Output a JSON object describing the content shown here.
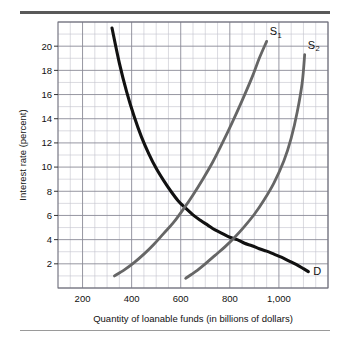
{
  "figure": {
    "background": "#ffffff",
    "rule_top_color": "#595959",
    "rule_bottom_color": "#9a9a9a"
  },
  "chart_data": {
    "type": "line",
    "title": "",
    "xlabel": "Quantity of loanable funds (in billions of dollars)",
    "ylabel": "Interest rate (percent)",
    "xlim": [
      100,
      1200
    ],
    "ylim": [
      0,
      22
    ],
    "grid": true,
    "grid_major_color": "#8a8a96",
    "grid_minor_color": "#c3c3cc",
    "x_major_step": 200,
    "x_minor_step": 50,
    "y_major_step": 2,
    "y_minor_step": 1,
    "xticks": [
      200,
      400,
      600,
      800,
      1000
    ],
    "xticklabels": [
      "200",
      "400",
      "600",
      "800",
      "1,000"
    ],
    "yticks": [
      2,
      4,
      6,
      8,
      10,
      12,
      14,
      16,
      18,
      20
    ],
    "yticklabels": [
      "2",
      "4",
      "6",
      "8",
      "10",
      "12",
      "14",
      "16",
      "18",
      "20"
    ],
    "legend_position": "inline-curve-labels",
    "series": [
      {
        "name": "D",
        "label": "D",
        "label_sub": "",
        "color": "#111111",
        "width": 3.1,
        "points": [
          [
            320,
            21.5
          ],
          [
            350,
            18.6
          ],
          [
            380,
            16.2
          ],
          [
            410,
            14.2
          ],
          [
            440,
            12.5
          ],
          [
            470,
            11.1
          ],
          [
            500,
            9.9
          ],
          [
            530,
            8.9
          ],
          [
            560,
            8.0
          ],
          [
            590,
            7.2
          ],
          [
            620,
            6.6
          ],
          [
            650,
            6.05
          ],
          [
            680,
            5.6
          ],
          [
            710,
            5.2
          ],
          [
            740,
            4.8
          ],
          [
            770,
            4.5
          ],
          [
            800,
            4.2
          ],
          [
            830,
            4.0
          ],
          [
            860,
            3.7
          ],
          [
            890,
            3.5
          ],
          [
            920,
            3.25
          ],
          [
            950,
            3.05
          ],
          [
            980,
            2.8
          ],
          [
            1010,
            2.55
          ],
          [
            1040,
            2.25
          ],
          [
            1070,
            1.95
          ],
          [
            1100,
            1.6
          ],
          [
            1120,
            1.35
          ]
        ]
      },
      {
        "name": "S1",
        "label": "S",
        "label_sub": "1",
        "color": "#666666",
        "width": 2.8,
        "points": [
          [
            330,
            1.0
          ],
          [
            370,
            1.5
          ],
          [
            410,
            2.1
          ],
          [
            450,
            2.8
          ],
          [
            490,
            3.6
          ],
          [
            530,
            4.5
          ],
          [
            570,
            5.4
          ],
          [
            610,
            6.5
          ],
          [
            650,
            7.7
          ],
          [
            690,
            9.0
          ],
          [
            730,
            10.4
          ],
          [
            770,
            12.0
          ],
          [
            810,
            13.7
          ],
          [
            850,
            15.5
          ],
          [
            890,
            17.4
          ],
          [
            920,
            19.0
          ],
          [
            950,
            20.4
          ]
        ]
      },
      {
        "name": "S2",
        "label": "S",
        "label_sub": "2",
        "color": "#666666",
        "width": 2.8,
        "points": [
          [
            620,
            0.8
          ],
          [
            660,
            1.35
          ],
          [
            700,
            2.0
          ],
          [
            740,
            2.7
          ],
          [
            780,
            3.4
          ],
          [
            820,
            4.2
          ],
          [
            860,
            5.1
          ],
          [
            900,
            6.1
          ],
          [
            940,
            7.3
          ],
          [
            980,
            8.7
          ],
          [
            1020,
            10.5
          ],
          [
            1050,
            12.4
          ],
          [
            1075,
            14.6
          ],
          [
            1095,
            17.0
          ],
          [
            1105,
            19.3
          ]
        ]
      }
    ],
    "annotations": [
      {
        "name": "equilibrium-d-s1",
        "x": 650,
        "y": 6.05,
        "text": ""
      },
      {
        "name": "equilibrium-d-s2",
        "x": 830,
        "y": 4.0,
        "text": ""
      }
    ]
  }
}
